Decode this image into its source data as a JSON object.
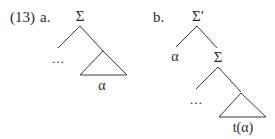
{
  "example": {
    "number": "(13)",
    "a": {
      "label": "a.",
      "root": "Σ",
      "left_leaf": "…",
      "triangle_label": "α"
    },
    "b": {
      "label": "b.",
      "root": "Σ′",
      "left_leaf": "α",
      "inner_node": "Σ",
      "inner_left_leaf": "…",
      "triangle_label": "t(α)"
    }
  },
  "colors": {
    "text": "#2a2a2a",
    "lines": "#3a3a3a",
    "background": "#ffffff"
  }
}
